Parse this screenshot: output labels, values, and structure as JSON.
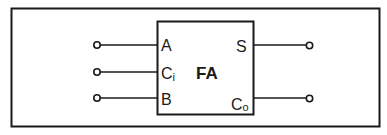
{
  "diagram": {
    "block_label": "FA",
    "inputs": [
      {
        "label": "A",
        "sub": ""
      },
      {
        "label": "C",
        "sub": "i"
      },
      {
        "label": "B",
        "sub": ""
      }
    ],
    "outputs": [
      {
        "label": "S",
        "sub": ""
      },
      {
        "label": "C",
        "sub": "o"
      }
    ],
    "colors": {
      "stroke": "#1a1a1a",
      "background": "#ffffff"
    }
  }
}
